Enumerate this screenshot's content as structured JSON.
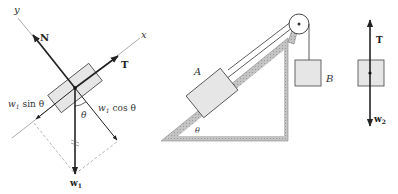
{
  "figure": {
    "colors": {
      "stroke": "#222222",
      "block_fill": "#e6e6e6",
      "incline_fill": "#bdbdbd",
      "axis": "#777777",
      "dashed": "#999999"
    }
  },
  "fbd_a": {
    "axis_x_label": "x",
    "axis_y_label": "y",
    "normal_label": "N",
    "tension_label": "T",
    "weight_label": "w",
    "weight_sub": "1",
    "parallel_component_label": "w",
    "parallel_component_sub": "1",
    "parallel_component_func": "sin θ",
    "perpendicular_component_label": "w",
    "perpendicular_component_sub": "1",
    "perpendicular_component_func": "cos θ",
    "angle_label": "θ"
  },
  "setup": {
    "block_a_label": "A",
    "block_b_label": "B",
    "incline_angle_label": "θ"
  },
  "fbd_b": {
    "tension_label": "T",
    "weight_label": "w",
    "weight_sub": "2"
  }
}
